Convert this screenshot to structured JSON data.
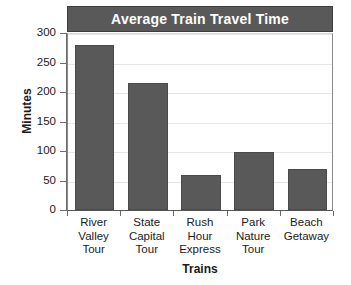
{
  "chart_data": {
    "type": "bar",
    "title": "Average Train Travel Time",
    "xlabel": "Trains",
    "ylabel": "Minutes",
    "categories": [
      "River Valley Tour",
      "State Capital Tour",
      "Rush Hour Express",
      "Park Nature Tour",
      "Beach Getaway"
    ],
    "category_lines": [
      [
        "River",
        "Valley",
        "Tour"
      ],
      [
        "State",
        "Capital",
        "Tour"
      ],
      [
        "Rush",
        "Hour",
        "Express"
      ],
      [
        "Park",
        "Nature",
        "Tour"
      ],
      [
        "Beach",
        "Getaway"
      ]
    ],
    "values": [
      280,
      215,
      60,
      98,
      69
    ],
    "ylim": [
      0,
      300
    ],
    "yticks": [
      0,
      50,
      100,
      150,
      200,
      250,
      300
    ],
    "ytick_labels": [
      "0",
      "50",
      "100",
      "150",
      "200",
      "250",
      "300"
    ],
    "grid": true,
    "legend": "none",
    "bar_color": "#595959",
    "title_banner_color": "#595959",
    "title_text_color": "#ffffff",
    "gridline_color": "#e6e6e6",
    "axis_color": "#6b6b6b",
    "background": "#ffffff"
  }
}
